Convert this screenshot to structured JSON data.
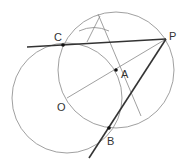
{
  "diagram": {
    "type": "geometric-construction",
    "points": {
      "C": {
        "label": "C",
        "x": 63,
        "y": 45,
        "lx": 54,
        "ly": 41
      },
      "P": {
        "label": "P",
        "x": 166,
        "y": 39,
        "lx": 169,
        "ly": 40
      },
      "A": {
        "label": "A",
        "x": 116,
        "y": 70,
        "lx": 121,
        "ly": 78
      },
      "O": {
        "label": "O",
        "x": 67,
        "y": 98,
        "lx": 57,
        "ly": 111
      },
      "B": {
        "label": "B",
        "x": 109,
        "y": 128,
        "lx": 107,
        "ly": 145
      }
    },
    "circles": [
      {
        "name": "circle-O",
        "cx": 67,
        "cy": 98,
        "r": 55
      },
      {
        "name": "circle-A",
        "cx": 116,
        "cy": 70,
        "r": 58
      }
    ],
    "lines": [
      {
        "name": "tangent-PC",
        "x1": 27,
        "y1": 47,
        "x2": 166,
        "y2": 39,
        "weight": "bold"
      },
      {
        "name": "tangent-PB",
        "x1": 166,
        "y1": 39,
        "x2": 89,
        "y2": 158,
        "weight": "bold"
      },
      {
        "name": "segment-OP",
        "x1": 67,
        "y1": 98,
        "x2": 166,
        "y2": 39,
        "weight": "thin"
      },
      {
        "name": "perpendicular-bisector",
        "x1": 98,
        "y1": 14,
        "x2": 141,
        "y2": 116,
        "weight": "thin"
      }
    ],
    "arcs": [
      {
        "name": "construction-arc",
        "path": "M 79 31 Q 94 24 109 31"
      }
    ],
    "colors": {
      "thin_stroke": "#888888",
      "bold_stroke": "#333333",
      "point_fill": "#111111",
      "label": "#333333"
    }
  }
}
